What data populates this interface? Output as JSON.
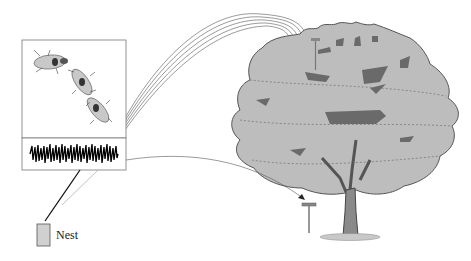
{
  "figure": {
    "type": "biology-illustration",
    "labels": {
      "nest": "Nest"
    },
    "panels": [
      {
        "name": "insect-panel",
        "content": "three beetles in a chain"
      },
      {
        "name": "waveform-panel",
        "content": "acoustic signal oscillogram"
      }
    ],
    "colors": {
      "canopy": "#b8b8b8",
      "canopy_dark": "#6a6a6a",
      "trunk": "#8a8a8a",
      "lines": "#555555",
      "nest_fill": "#cfcfcf"
    }
  }
}
